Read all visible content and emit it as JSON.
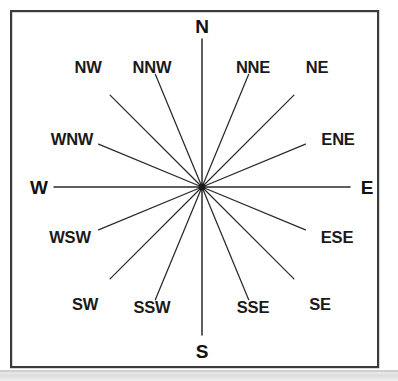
{
  "figure": {
    "background_color": "#ffffff",
    "line_color": "#2a2a2a",
    "text_color": "#1a1a1a",
    "frame_color": "#3b3b3b"
  },
  "chart_data": {
    "type": "scatter",
    "title": "",
    "xlabel": "",
    "ylabel": "",
    "grid": false,
    "legend": "none",
    "center": {
      "x": 202,
      "y": 187
    },
    "points": [
      {
        "abbr": "N",
        "bearing_deg": 0,
        "weight": "bold",
        "label_x": 202,
        "label_y": 33,
        "anchor": "middle",
        "ray_inner": 12,
        "ray_outer": 148
      },
      {
        "abbr": "NNE",
        "bearing_deg": 22.5,
        "weight": "regular",
        "label_x": 253,
        "label_y": 73,
        "anchor": "middle",
        "ray_inner": 12,
        "ray_outer": 122
      },
      {
        "abbr": "NE",
        "bearing_deg": 45,
        "weight": "regular",
        "label_x": 317,
        "label_y": 73,
        "anchor": "middle",
        "ray_inner": 12,
        "ray_outer": 130
      },
      {
        "abbr": "ENE",
        "bearing_deg": 67.5,
        "weight": "regular",
        "label_x": 338,
        "label_y": 145,
        "anchor": "middle",
        "ray_inner": 12,
        "ray_outer": 112
      },
      {
        "abbr": "E",
        "bearing_deg": 90,
        "weight": "bold",
        "label_x": 367,
        "label_y": 194,
        "anchor": "middle",
        "ray_inner": 12,
        "ray_outer": 148
      },
      {
        "abbr": "ESE",
        "bearing_deg": 112.5,
        "weight": "regular",
        "label_x": 337,
        "label_y": 243,
        "anchor": "middle",
        "ray_inner": 12,
        "ray_outer": 112
      },
      {
        "abbr": "SE",
        "bearing_deg": 135,
        "weight": "regular",
        "label_x": 320,
        "label_y": 310,
        "anchor": "middle",
        "ray_inner": 12,
        "ray_outer": 130
      },
      {
        "abbr": "SSE",
        "bearing_deg": 157.5,
        "weight": "regular",
        "label_x": 253,
        "label_y": 313,
        "anchor": "middle",
        "ray_inner": 12,
        "ray_outer": 122
      },
      {
        "abbr": "S",
        "bearing_deg": 180,
        "weight": "bold",
        "label_x": 202,
        "label_y": 358,
        "anchor": "middle",
        "ray_inner": 12,
        "ray_outer": 148
      },
      {
        "abbr": "SSW",
        "bearing_deg": 202.5,
        "weight": "regular",
        "label_x": 152,
        "label_y": 313,
        "anchor": "middle",
        "ray_inner": 12,
        "ray_outer": 122
      },
      {
        "abbr": "SW",
        "bearing_deg": 225,
        "weight": "regular",
        "label_x": 85,
        "label_y": 310,
        "anchor": "middle",
        "ray_inner": 12,
        "ray_outer": 130
      },
      {
        "abbr": "WSW",
        "bearing_deg": 247.5,
        "weight": "regular",
        "label_x": 70,
        "label_y": 243,
        "anchor": "middle",
        "ray_inner": 12,
        "ray_outer": 112
      },
      {
        "abbr": "W",
        "bearing_deg": 270,
        "weight": "bold",
        "label_x": 39,
        "label_y": 194,
        "anchor": "middle",
        "ray_inner": 12,
        "ray_outer": 148
      },
      {
        "abbr": "WNW",
        "bearing_deg": 292.5,
        "weight": "regular",
        "label_x": 72,
        "label_y": 145,
        "anchor": "middle",
        "ray_inner": 12,
        "ray_outer": 112
      },
      {
        "abbr": "NW",
        "bearing_deg": 315,
        "weight": "regular",
        "label_x": 88,
        "label_y": 73,
        "anchor": "middle",
        "ray_inner": 12,
        "ray_outer": 130
      },
      {
        "abbr": "NNW",
        "bearing_deg": 337.5,
        "weight": "regular",
        "label_x": 152,
        "label_y": 73,
        "anchor": "middle",
        "ray_inner": 12,
        "ray_outer": 122
      }
    ]
  },
  "frame": {
    "x": 10,
    "y": 10,
    "width": 369,
    "height": 358
  }
}
